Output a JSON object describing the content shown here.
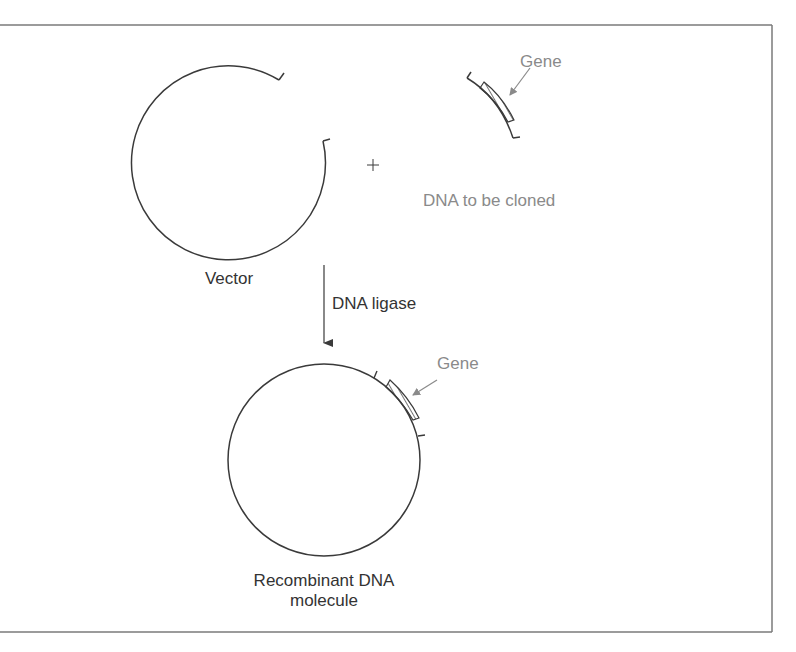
{
  "diagram": {
    "type": "molecular-cloning-schematic",
    "colors": {
      "line": "#3a3a3a",
      "frame": "#7a7a7a",
      "label_dark": "#333333",
      "label_gray": "#8a8a8a"
    },
    "labels": {
      "vector": "Vector",
      "plus": "+",
      "dna_to_be_cloned": "DNA to be cloned",
      "gene_top": "Gene",
      "dna_ligase": "DNA ligase",
      "gene_bottom": "Gene",
      "recombinant_line1": "Recombinant DNA",
      "recombinant_line2": "molecule"
    },
    "nodes": [
      {
        "id": "vector",
        "shape": "open-circle",
        "label": "Vector"
      },
      {
        "id": "insert",
        "shape": "arc-fragment-with-hatched-gene",
        "label": "DNA to be cloned",
        "sublabel": "Gene"
      },
      {
        "id": "recombinant",
        "shape": "closed-circle-with-hatched-gene",
        "label": "Recombinant DNA molecule",
        "sublabel": "Gene"
      }
    ],
    "edges": [
      {
        "from": "vector+insert",
        "to": "recombinant",
        "label": "DNA ligase"
      }
    ]
  }
}
